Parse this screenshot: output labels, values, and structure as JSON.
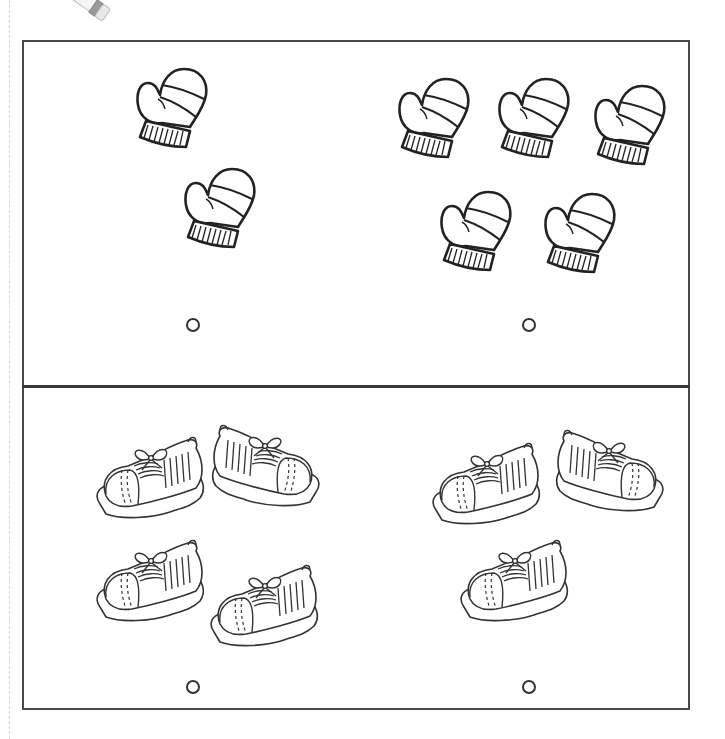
{
  "worksheet": {
    "topic": "Counting - which group has more",
    "rows": [
      {
        "name": "mittens",
        "groups": [
          {
            "object": "mitten",
            "count": 2,
            "answer_selected": false
          },
          {
            "object": "mitten",
            "count": 5,
            "answer_selected": false
          }
        ]
      },
      {
        "name": "sneakers",
        "groups": [
          {
            "object": "sneaker",
            "count": 4,
            "answer_selected": false
          },
          {
            "object": "sneaker",
            "count": 3,
            "answer_selected": false
          }
        ]
      }
    ],
    "icons": {
      "decoration": "pencil-icon",
      "answer": "answer-circle-icon"
    },
    "colors": {
      "line": "#333333",
      "frame": "#4a4a4a",
      "background": "#ffffff"
    }
  }
}
